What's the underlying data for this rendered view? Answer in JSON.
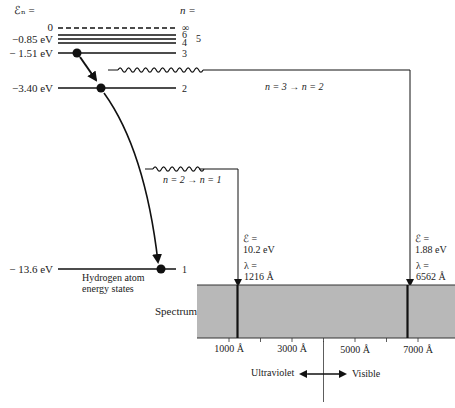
{
  "header": {
    "energy_label": "ℰₙ =",
    "n_label": "n ="
  },
  "levels": [
    {
      "n": "∞",
      "energy": "0",
      "dashed": true
    },
    {
      "n": "6",
      "energy": ""
    },
    {
      "n": "5",
      "energy": "−0.85 eV"
    },
    {
      "n": "4",
      "energy": ""
    },
    {
      "n": "3",
      "energy": "− 1.51 eV"
    },
    {
      "n": "2",
      "energy": "−3.40 eV"
    },
    {
      "n": "1",
      "energy": "− 13.6 eV"
    }
  ],
  "level_labels": {
    "inf": "∞",
    "six": "6",
    "five": "5",
    "four": "4",
    "three": "3",
    "two": "2",
    "one": "1",
    "e0": "0",
    "e085": "−0.85 eV",
    "e151": "− 1.51 eV",
    "e340": "−3.40 eV",
    "e136": "− 13.6 eV"
  },
  "caption": {
    "line1": "Hydrogen atom",
    "line2": "energy states"
  },
  "transitions": [
    {
      "label": "n = 3 → n = 2",
      "energy_label": "ℰ =",
      "energy": "1.88 eV",
      "lambda_label": "λ =",
      "wavelength": "6562 Å"
    },
    {
      "label": "n = 2 → n = 1",
      "energy_label": "ℰ =",
      "energy": "10.2 eV",
      "lambda_label": "λ =",
      "wavelength": "1216 Å"
    }
  ],
  "spectrum": {
    "label": "Spectrum",
    "color": "#b8b8b8",
    "ticks": [
      "1000 Å",
      "3000 Å",
      "5000 Å",
      "7000 Å"
    ],
    "uv_label": "Ultraviolet",
    "visible_label": "Visible"
  }
}
